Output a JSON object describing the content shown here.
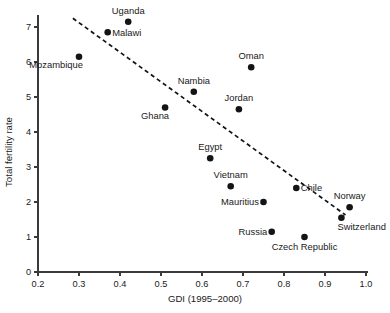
{
  "chart_data": {
    "type": "scatter",
    "title": "",
    "xlabel": "GDI (1995–2000)",
    "ylabel": "Total fertility rate",
    "xlim": [
      0.2,
      1.0
    ],
    "ylim": [
      0,
      7.4
    ],
    "xticks": [
      "0.2",
      "0.3",
      "0.4",
      "0.5",
      "0.6",
      "0.7",
      "0.8",
      "0.9",
      "1.0"
    ],
    "xtick_values": [
      0.2,
      0.3,
      0.4,
      0.5,
      0.6,
      0.7,
      0.8,
      0.9,
      1.0
    ],
    "yticks": [
      "0",
      "1",
      "2",
      "3",
      "4",
      "5",
      "6",
      "7"
    ],
    "ytick_values": [
      0,
      1,
      2,
      3,
      4,
      5,
      6,
      7
    ],
    "grid": false,
    "legend": "none",
    "points": [
      {
        "label": "Uganda",
        "x": 0.42,
        "y": 7.15,
        "label_pos": "above"
      },
      {
        "label": "Malawi",
        "x": 0.37,
        "y": 6.85,
        "label_pos": "right"
      },
      {
        "label": "Mozambique",
        "x": 0.3,
        "y": 6.15,
        "label_pos": "below-left"
      },
      {
        "label": "Oman",
        "x": 0.72,
        "y": 5.85,
        "label_pos": "above"
      },
      {
        "label": "Nambia",
        "x": 0.58,
        "y": 5.15,
        "label_pos": "above"
      },
      {
        "label": "Ghana",
        "x": 0.51,
        "y": 4.7,
        "label_pos": "below-left"
      },
      {
        "label": "Jordan",
        "x": 0.69,
        "y": 4.65,
        "label_pos": "above"
      },
      {
        "label": "Egypt",
        "x": 0.62,
        "y": 3.25,
        "label_pos": "above"
      },
      {
        "label": "Vietnam",
        "x": 0.67,
        "y": 2.45,
        "label_pos": "above"
      },
      {
        "label": "Chile",
        "x": 0.83,
        "y": 2.4,
        "label_pos": "right"
      },
      {
        "label": "Mauritius",
        "x": 0.75,
        "y": 2.0,
        "label_pos": "left"
      },
      {
        "label": "Norway",
        "x": 0.96,
        "y": 1.85,
        "label_pos": "above"
      },
      {
        "label": "Switzerland",
        "x": 0.94,
        "y": 1.55,
        "label_pos": "below-right"
      },
      {
        "label": "Russia",
        "x": 0.77,
        "y": 1.15,
        "label_pos": "left"
      },
      {
        "label": "Czech Republic",
        "x": 0.85,
        "y": 1.0,
        "label_pos": "below"
      }
    ],
    "trend_line": {
      "style": "dashed",
      "x_start": 0.285,
      "y_start": 7.25,
      "x_end": 0.95,
      "y_end": 1.63
    }
  },
  "watermark": {
    "text": ""
  }
}
